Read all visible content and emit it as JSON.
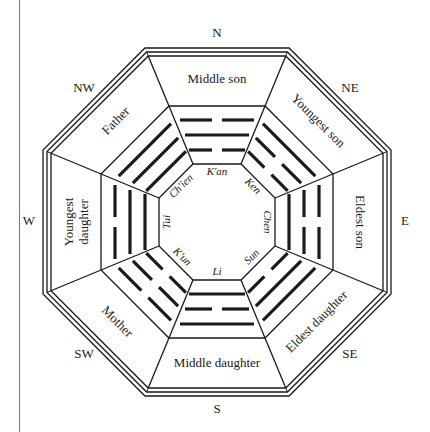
{
  "colors": {
    "line": "#1a1a1a",
    "background": "#ffffff",
    "margin_rule": "#555555"
  },
  "sectors": [
    {
      "direction": "N",
      "relationship": "Middle son",
      "trigram": "K'an",
      "lines_inner_to_outer": [
        "broken",
        "solid",
        "broken"
      ]
    },
    {
      "direction": "NE",
      "relationship": "Youngest son",
      "trigram": "Ken",
      "lines_inner_to_outer": [
        "broken",
        "broken",
        "solid"
      ]
    },
    {
      "direction": "E",
      "relationship": "Eldest son",
      "trigram": "Chen",
      "lines_inner_to_outer": [
        "solid",
        "broken",
        "broken"
      ]
    },
    {
      "direction": "SE",
      "relationship": "Eldest daughter",
      "trigram": "Sun",
      "lines_inner_to_outer": [
        "broken",
        "solid",
        "solid"
      ]
    },
    {
      "direction": "S",
      "relationship": "Middle daughter",
      "trigram": "Li",
      "lines_inner_to_outer": [
        "solid",
        "broken",
        "solid"
      ]
    },
    {
      "direction": "SW",
      "relationship": "Mother",
      "trigram": "K'un",
      "lines_inner_to_outer": [
        "broken",
        "broken",
        "broken"
      ]
    },
    {
      "direction": "W",
      "relationship": "Youngest daughter",
      "trigram": "Tui",
      "lines_inner_to_outer": [
        "solid",
        "solid",
        "broken"
      ]
    },
    {
      "direction": "NW",
      "relationship": "Father",
      "trigram": "Ch'ien",
      "lines_inner_to_outer": [
        "solid",
        "solid",
        "solid"
      ]
    }
  ]
}
